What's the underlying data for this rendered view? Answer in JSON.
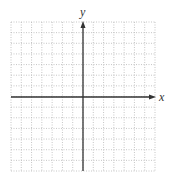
{
  "diagram": {
    "type": "coordinate-grid",
    "x_axis_label": "x",
    "y_axis_label": "y",
    "grid": {
      "columns": 14,
      "rows": 14,
      "left": 11,
      "right": 155,
      "top": 22,
      "bottom": 171,
      "origin_x": 83,
      "origin_y": 97,
      "line_style": "dotted"
    },
    "colors": {
      "grid": "#b8b8b8",
      "axis": "#333333",
      "background": "#ffffff"
    }
  }
}
